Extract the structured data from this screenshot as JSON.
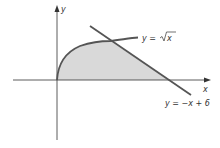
{
  "figure": {
    "axes": {
      "x_label": "x",
      "y_label": "y"
    },
    "curves": [
      {
        "name": "sqrt-curve",
        "label_prefix": "y = ",
        "label_func": "x",
        "equation": "y = √x"
      },
      {
        "name": "line",
        "label": "y = −x + 6",
        "equation": "y = -x + 6"
      }
    ],
    "region": {
      "description": "Shaded region bounded by y = √x, y = -x + 6, and the x-axis"
    },
    "colors": {
      "axis": "#333333",
      "curve": "#555555",
      "shade": "#d9d9d9",
      "text": "#333333"
    }
  }
}
